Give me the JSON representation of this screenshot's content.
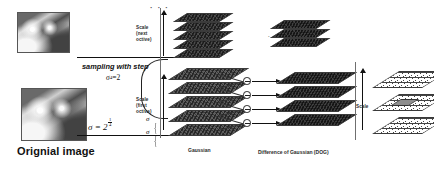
{
  "figure": {
    "title_caption": "Orignial image",
    "labels": {
      "scale_next_octave_l1": "Scale",
      "scale_next_octave_l2": "(next",
      "scale_next_octave_l3": "octive)",
      "scale_first_octave_l1": "Scale",
      "scale_first_octave_l2": "(first",
      "scale_first_octave_l3": "octive)",
      "sampling": "sampling with step",
      "sampling_sigma": "σ",
      "sampling_sigma_sup": "4",
      "sampling_eq": " =2",
      "sigma_brace_top": "σ",
      "sigma_brace_bottom": "σ",
      "sigma_eq_base": "σ = 2",
      "sigma_exp_num": "1",
      "sigma_exp_den": "4",
      "gaussian": "Gaussian",
      "dog": "Difference of Gaussian (DOG)",
      "scale_right": "Scale",
      "dots_top": "· · ·",
      "dots_middle": "· · · · · ·"
    },
    "colors": {
      "ink": "#111111",
      "plane_dark": "#4a4a4a",
      "plane_dog": "#3f3f3f",
      "grid_line": "#444444",
      "highlight": "#8e8e8e",
      "background": "#ffffff"
    }
  }
}
